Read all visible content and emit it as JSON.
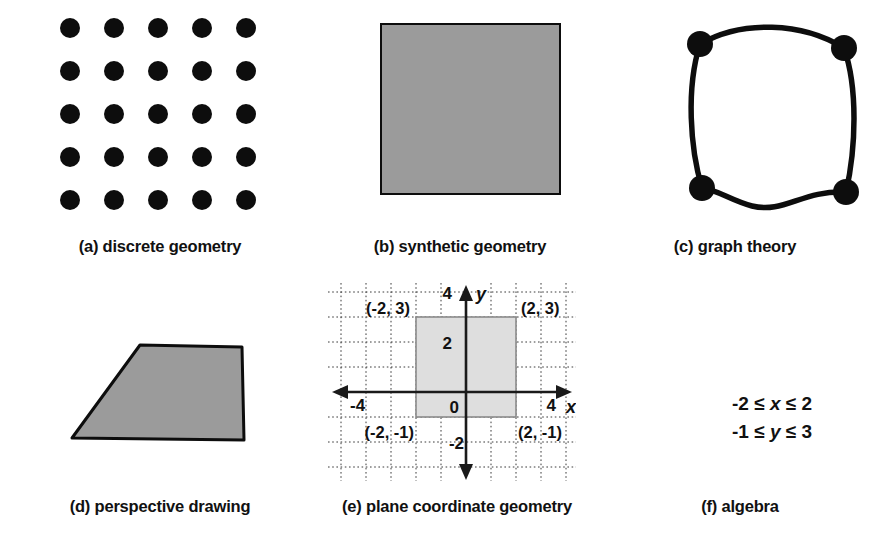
{
  "figure": {
    "title": "",
    "background_color": "#ffffff",
    "ink_color": "#0d0d0d",
    "fill_gray": "#9b9b9b",
    "grid_fill_gray": "#dedede"
  },
  "panels": [
    {
      "key": "a",
      "caption": "(a) discrete geometry",
      "kind": "dot-lattice",
      "rows": 5,
      "cols": 5,
      "dot_count": 25
    },
    {
      "key": "b",
      "caption": "(b) synthetic geometry",
      "kind": "filled-square",
      "fill": "#9b9b9b",
      "stroke": "#0d0d0d"
    },
    {
      "key": "c",
      "caption": "(c) graph theory",
      "kind": "graph",
      "vertex_count": 4,
      "edge_count": 4,
      "vertices": [
        {
          "name": "top-left",
          "x": 28,
          "y": 26
        },
        {
          "name": "top-right",
          "x": 172,
          "y": 30
        },
        {
          "name": "bottom-left",
          "x": 30,
          "y": 170
        },
        {
          "name": "bottom-right",
          "x": 174,
          "y": 174
        }
      ]
    },
    {
      "key": "d",
      "caption": "(d) perspective drawing",
      "kind": "trapezoid",
      "fill": "#9b9b9b",
      "stroke": "#0d0d0d",
      "vertices": [
        {
          "x": 80,
          "y": 10
        },
        {
          "x": 182,
          "y": 12
        },
        {
          "x": 184,
          "y": 105
        },
        {
          "x": 12,
          "y": 103
        }
      ]
    },
    {
      "key": "e",
      "caption": "(e) plane coordinate geometry",
      "kind": "coordinate-plane"
    },
    {
      "key": "f",
      "caption": "(f) algebra",
      "kind": "inequalities"
    }
  ],
  "chart_data": {
    "type": "scatter",
    "title": "",
    "xlabel": "x",
    "ylabel": "y",
    "xlim": [
      -5,
      5
    ],
    "ylim": [
      -3,
      5
    ],
    "grid": true,
    "grid_style": "dotted",
    "grid_spacing": 1,
    "legend": "none",
    "x_tick_labels": [
      "-4",
      "4"
    ],
    "x_tick_values": [
      -4,
      4
    ],
    "y_tick_labels": [
      "4",
      "2",
      "0",
      "-2"
    ],
    "y_tick_values": [
      4,
      2,
      0,
      -2
    ],
    "origin_label": "0",
    "axis_arrows": [
      "left",
      "right",
      "up",
      "down"
    ],
    "shaded_region": {
      "name": "rectangle",
      "x_min": -2,
      "x_max": 2,
      "y_min": -1,
      "y_max": 3,
      "fill": "#dedede",
      "stroke": "#8a8a8a"
    },
    "annotations": [
      {
        "label": "(-2, 3)",
        "x": -2,
        "y": 3,
        "placement": "upper-left"
      },
      {
        "label": "(2, 3)",
        "x": 2,
        "y": 3,
        "placement": "upper-right"
      },
      {
        "label": "(-2, -1)",
        "x": -2,
        "y": -1,
        "placement": "lower-left"
      },
      {
        "label": "(2, -1)",
        "x": 2,
        "y": -1,
        "placement": "lower-right"
      }
    ]
  },
  "algebra": {
    "line1_prefix": "-2 ≤ ",
    "line1_var": "x",
    "line1_suffix": " ≤ 2",
    "line2_prefix": "-1 ≤ ",
    "line2_var": "y",
    "line2_suffix": " ≤ 3",
    "line1_full": "-2 ≤ x ≤ 2",
    "line2_full": "-1 ≤ y ≤ 3"
  },
  "axis_labels": {
    "x": "x",
    "y": "y"
  }
}
